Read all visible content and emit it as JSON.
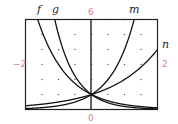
{
  "chart_data": {
    "type": "line",
    "title": "",
    "xlabel": "",
    "ylabel": "",
    "xlim": [
      -2,
      2
    ],
    "ylim": [
      0,
      6
    ],
    "x_tick_step": 0.5,
    "y_tick_step": 1,
    "grid": "dots",
    "window_labels": {
      "ymax": "6",
      "ymin": "0",
      "xmin": "-2",
      "xmax": "2"
    },
    "series": [
      {
        "name": "f",
        "type": "exponential",
        "base": 0.333,
        "x": [
          -1.6,
          -1,
          0,
          1,
          2
        ],
        "values": [
          5.8,
          3,
          1,
          0.33,
          0.11
        ]
      },
      {
        "name": "g",
        "type": "exponential",
        "base": 0.2,
        "x": [
          -1.1,
          -1,
          0,
          1,
          2
        ],
        "values": [
          5.9,
          5,
          1,
          0.2,
          0.04
        ]
      },
      {
        "name": "m",
        "type": "exponential",
        "base": 4,
        "x": [
          -2,
          -1,
          0,
          1,
          1.28
        ],
        "values": [
          0.06,
          0.25,
          1,
          4,
          5.9
        ]
      },
      {
        "name": "n",
        "type": "exponential",
        "base": 2,
        "x": [
          -2,
          -1,
          0,
          1,
          2
        ],
        "values": [
          0.25,
          0.5,
          1,
          2,
          4
        ]
      }
    ],
    "annotations": [
      "f",
      "g",
      "m",
      "n"
    ]
  },
  "labels": {
    "f": "f",
    "g": "g",
    "m": "m",
    "n": "n",
    "ymax": "6",
    "ymin": "0",
    "xmin": "−2",
    "xmax": "2"
  }
}
